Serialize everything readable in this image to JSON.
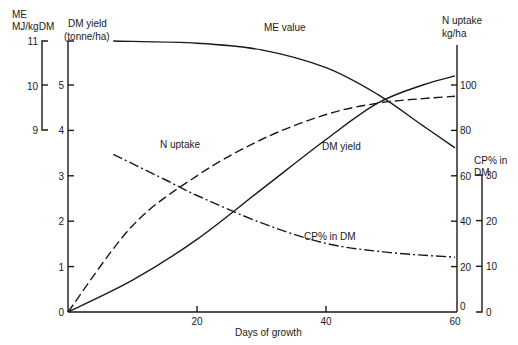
{
  "chart_data": {
    "type": "line",
    "title": "",
    "xlabel": "Days of growth",
    "x_ticks": [
      0,
      20,
      40,
      60
    ],
    "xlim": [
      0,
      60
    ],
    "grid": false,
    "legend": "inline labels on curves",
    "axes": {
      "me": {
        "label_line1": "ME",
        "label_line2": "MJ/kgDM",
        "ticks": [
          9,
          10,
          11
        ],
        "range": [
          9,
          11
        ],
        "position": "left-outer"
      },
      "dm": {
        "label_line1": "DM yield",
        "label_line2": "(tonne/ha)",
        "ticks": [
          0,
          1,
          2,
          3,
          4,
          5
        ],
        "range": [
          0,
          5.6
        ],
        "position": "left-inner"
      },
      "n": {
        "label_line1": "N uptake",
        "label_line2": "kg/ha",
        "ticks": [
          0,
          20,
          40,
          60,
          80,
          100
        ],
        "range": [
          0,
          110
        ],
        "position": "right-inner"
      },
      "cp": {
        "label_line1": "CP% in",
        "label_line2": "DM",
        "ticks": [
          0,
          10,
          20,
          30
        ],
        "range": [
          0,
          30
        ],
        "position": "right-outer"
      }
    },
    "series": [
      {
        "name": "DM yield",
        "axis": "dm",
        "style": "solid",
        "x": [
          0,
          10,
          20,
          30,
          40,
          48,
          55,
          60
        ],
        "values": [
          0,
          0.7,
          1.6,
          2.7,
          3.8,
          4.6,
          5.0,
          5.2
        ]
      },
      {
        "name": "N uptake",
        "axis": "n",
        "style": "dashed",
        "x": [
          0,
          10,
          20,
          30,
          40,
          48,
          55,
          60
        ],
        "values": [
          0,
          38,
          60,
          76,
          87,
          92,
          94,
          95
        ]
      },
      {
        "name": "ME value",
        "axis": "me",
        "style": "solid",
        "x": [
          7,
          20,
          30,
          40,
          48,
          55,
          60
        ],
        "values": [
          11.0,
          10.95,
          10.8,
          10.4,
          9.8,
          9.1,
          8.6
        ]
      },
      {
        "name": "CP% in DM",
        "axis": "cp",
        "style": "dash-dot",
        "x": [
          7,
          15,
          20,
          30,
          40,
          50,
          60
        ],
        "values": [
          34.5,
          29,
          25.5,
          19.5,
          15,
          13,
          12
        ]
      }
    ],
    "annotations": [
      {
        "text": "ME value",
        "near": "ME value curve"
      },
      {
        "text": "N uptake",
        "near": "N uptake curve"
      },
      {
        "text": "DM yield",
        "near": "DM yield curve"
      },
      {
        "text": "CP% in DM",
        "near": "CP% in DM curve"
      }
    ]
  }
}
